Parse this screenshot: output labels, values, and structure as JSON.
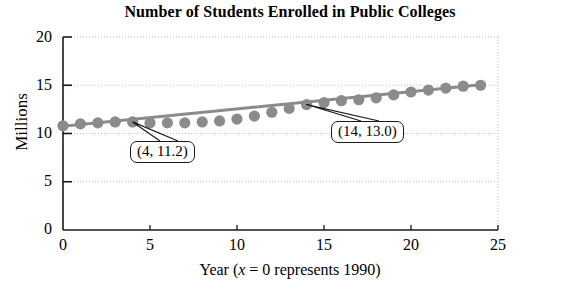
{
  "chart_data": {
    "type": "line",
    "title": "Number of Students Enrolled in Public Colleges",
    "xlabel_parts": {
      "pre": "Year (",
      "var": "x",
      "post": " = 0 represents 1990)"
    },
    "xlabel": "Year (x = 0 represents 1990)",
    "ylabel": "Millions",
    "xlim": [
      0,
      25
    ],
    "ylim": [
      0,
      20
    ],
    "xticks": [
      0,
      5,
      10,
      15,
      20,
      25
    ],
    "xtick_labels": [
      "0",
      "5",
      "10",
      "15",
      "20",
      "25"
    ],
    "yticks": [
      0,
      5,
      10,
      15,
      20
    ],
    "ytick_labels": [
      "0",
      "5",
      "10",
      "15",
      "20"
    ],
    "grid": "dotted horizontal gridlines at y = 5, 10, 15, 20 and dotted vertical gridline at x = 25",
    "legend": "none",
    "marker_color": "#8b8b8b",
    "line_color": "#8b8b8b",
    "axis_color": "#1a1a1a",
    "grid_color": "#bdbdbd",
    "x": [
      0,
      1,
      2,
      3,
      4,
      5,
      6,
      7,
      8,
      9,
      10,
      11,
      12,
      13,
      14,
      15,
      16,
      17,
      18,
      19,
      20,
      21,
      22,
      23,
      24
    ],
    "values": [
      10.8,
      11.0,
      11.1,
      11.2,
      11.2,
      11.1,
      11.1,
      11.1,
      11.2,
      11.3,
      11.5,
      11.8,
      12.2,
      12.6,
      13.0,
      13.2,
      13.4,
      13.5,
      13.7,
      14.0,
      14.3,
      14.5,
      14.7,
      14.9,
      15.0
    ],
    "trend_line": {
      "description": "linear regression line",
      "x": [
        0,
        24
      ],
      "y": [
        10.75,
        15.05
      ]
    },
    "annotations": [
      {
        "label": "(4, 11.2)",
        "point_x": 4,
        "point_y": 11.2
      },
      {
        "label": "(14, 13.0)",
        "point_x": 14,
        "point_y": 13.0
      }
    ]
  }
}
